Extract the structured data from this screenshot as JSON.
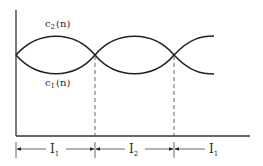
{
  "diagram": {
    "curves": [
      {
        "id": "c2",
        "label_main": "c",
        "label_sub": "2",
        "label_arg": "(n)"
      },
      {
        "id": "c1",
        "label_main": "c",
        "label_sub": "1",
        "label_arg": "(n)"
      }
    ],
    "intervals": [
      {
        "label_main": "I",
        "label_sub": "1"
      },
      {
        "label_main": "I",
        "label_sub": "2"
      },
      {
        "label_main": "I",
        "label_sub": "1"
      }
    ]
  }
}
